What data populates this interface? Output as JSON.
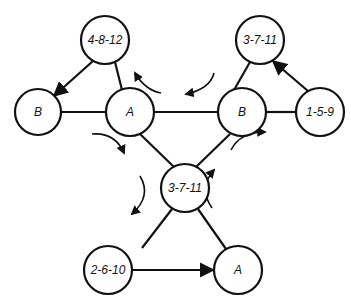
{
  "diagram": {
    "nodes": [
      {
        "id": "n1",
        "label": "4-8-12",
        "cx": 105,
        "cy": 40
      },
      {
        "id": "n2",
        "label": "B",
        "cx": 38,
        "cy": 112
      },
      {
        "id": "n3",
        "label": "A",
        "cx": 130,
        "cy": 112
      },
      {
        "id": "n4",
        "label": "B",
        "cx": 242,
        "cy": 112
      },
      {
        "id": "n5",
        "label": "3-7-11",
        "cx": 260,
        "cy": 40
      },
      {
        "id": "n6",
        "label": "1-5-9",
        "cx": 320,
        "cy": 112
      },
      {
        "id": "n7",
        "label": "3-7-11",
        "cx": 185,
        "cy": 188
      },
      {
        "id": "n8",
        "label": "2-6-10",
        "cx": 108,
        "cy": 270
      },
      {
        "id": "n9",
        "label": "A",
        "cx": 238,
        "cy": 270
      }
    ],
    "edges": [
      {
        "from": "n1",
        "to": "n2",
        "directed": true
      },
      {
        "from": "n1",
        "to": "n3",
        "directed": false
      },
      {
        "from": "n2",
        "to": "n3",
        "directed": false
      },
      {
        "from": "n3",
        "to": "n4",
        "directed": false
      },
      {
        "from": "n4",
        "to": "n5",
        "directed": false
      },
      {
        "from": "n6",
        "to": "n5",
        "directed": true
      },
      {
        "from": "n4",
        "to": "n6",
        "directed": false
      },
      {
        "from": "n3",
        "to": "n7",
        "directed": false
      },
      {
        "from": "n4",
        "to": "n7",
        "directed": false
      },
      {
        "from": "n7",
        "to": "n8",
        "directed": false
      },
      {
        "from": "n7",
        "to": "n9",
        "directed": false
      },
      {
        "from": "n8",
        "to": "n9",
        "directed": true
      }
    ],
    "rotation_arrows": [
      {
        "position": "above-A-right",
        "direction": "counterclockwise"
      },
      {
        "position": "above-B-left",
        "direction": "counterclockwise"
      },
      {
        "position": "below-A-right",
        "direction": "clockwise"
      },
      {
        "position": "left-of-center",
        "direction": "counterclockwise"
      },
      {
        "position": "right-of-center",
        "direction": "counterclockwise"
      },
      {
        "position": "below-B-left",
        "direction": "clockwise"
      }
    ]
  }
}
